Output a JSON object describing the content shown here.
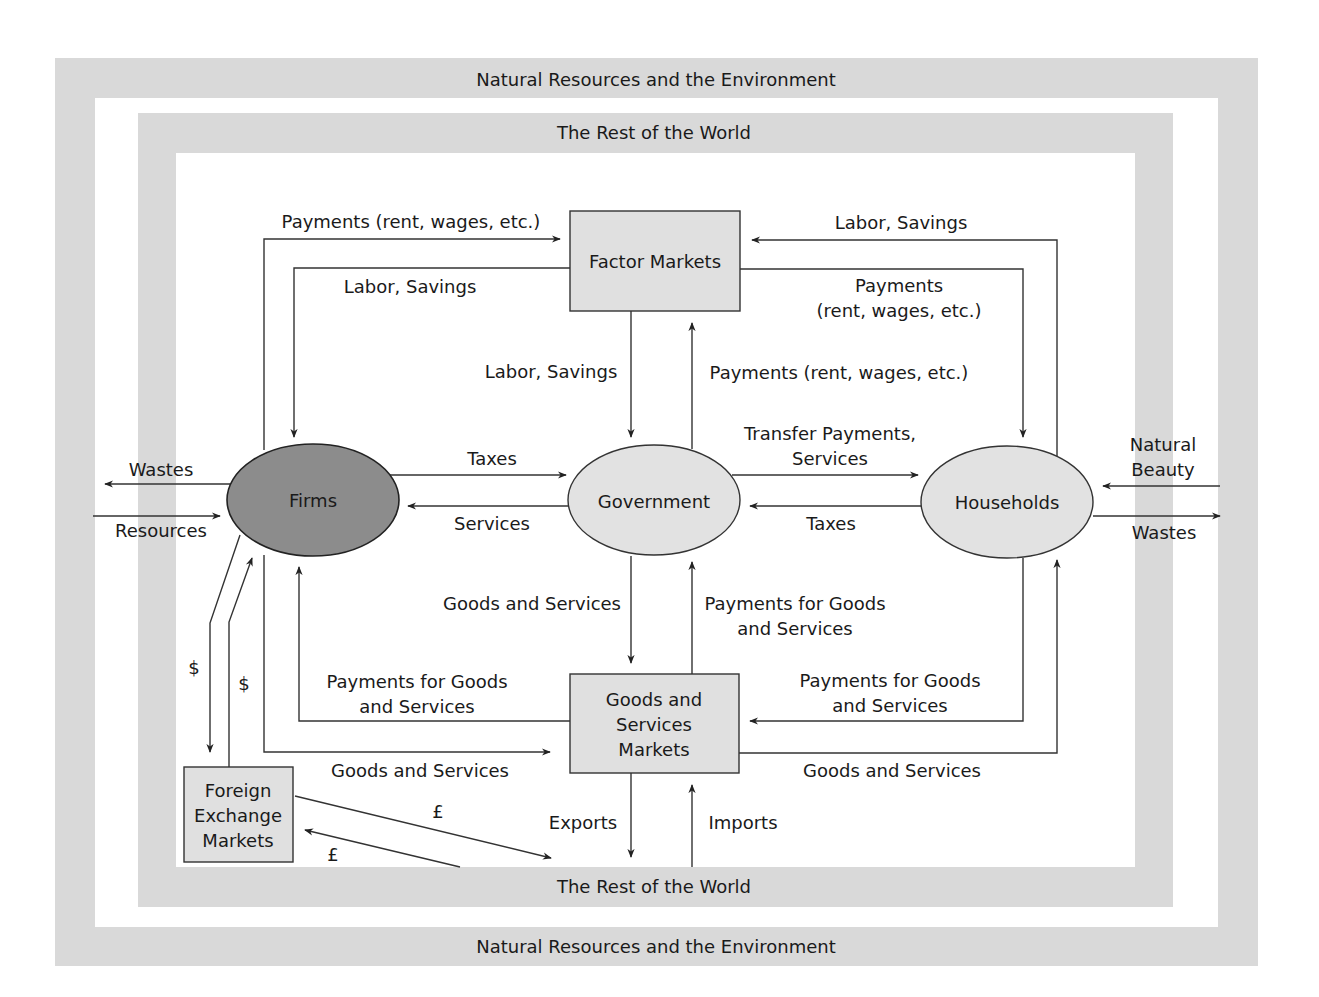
{
  "colors": {
    "band": "#d9d9d9",
    "box_fill": "#e0e0e0",
    "firms_fill": "#8c8c8c",
    "ellipse_fill": "#e2e2e2",
    "line": "#333333"
  },
  "bands": {
    "outer_top": "Natural Resources and the Environment",
    "outer_bottom": "Natural Resources and the Environment",
    "inner_top": "The Rest of the World",
    "inner_bottom": "The Rest of the World"
  },
  "nodes": {
    "firms": "Firms",
    "government": "Government",
    "households": "Households",
    "factor_markets": "Factor Markets",
    "goods_markets": [
      "Goods and",
      "Services",
      "Markets"
    ],
    "fx_markets": [
      "Foreign",
      "Exchange",
      "Markets"
    ]
  },
  "flows": {
    "firms_to_factor": "Payments (rent, wages, etc.)",
    "factor_to_firms": "Labor, Savings",
    "hh_to_factor": "Labor, Savings",
    "factor_to_hh": [
      "Payments",
      "(rent, wages, etc.)"
    ],
    "factor_to_gov": "Labor, Savings",
    "gov_to_factor": "Payments (rent, wages, etc.)",
    "firms_to_gov": "Taxes",
    "gov_to_firms": "Services",
    "gov_to_hh": [
      "Transfer Payments,",
      "Services"
    ],
    "hh_to_gov": "Taxes",
    "gov_to_goods": "Goods and Services",
    "goods_to_gov_payment": [
      "Payments for Goods",
      "and Services"
    ],
    "goods_to_firms": [
      "Payments for Goods",
      "and Services"
    ],
    "firms_to_goods": "Goods and Services",
    "hh_to_goods": [
      "Payments for Goods",
      "and Services"
    ],
    "goods_to_hh": "Goods and Services",
    "exports": "Exports",
    "imports": "Imports",
    "firms_wastes": "Wastes",
    "firms_resources": "Resources",
    "hh_natural_beauty": [
      "Natural",
      "Beauty"
    ],
    "hh_wastes": "Wastes",
    "fx_dollar_down": "$",
    "fx_dollar_up": "$",
    "fx_pound_out": "£",
    "fx_pound_in": "£"
  }
}
